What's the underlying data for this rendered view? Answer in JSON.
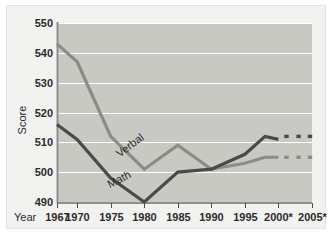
{
  "chart_data": {
    "type": "line",
    "title": "",
    "subtitle": "",
    "xlabel": "Year",
    "ylabel": "Score",
    "ylim": [
      490,
      550
    ],
    "yticks": [
      490,
      500,
      510,
      520,
      530,
      540,
      550
    ],
    "ytick_labels": [
      "490",
      "500",
      "510",
      "520",
      "530",
      "540",
      "550"
    ],
    "xlim": [
      1967,
      2005
    ],
    "xticks": [
      1967,
      1970,
      1975,
      1980,
      1985,
      1990,
      1995,
      2000,
      2005
    ],
    "xtick_labels": [
      "1967",
      "1970",
      "1975",
      "1980",
      "1985",
      "1990",
      "1995",
      "2000*",
      "2005*"
    ],
    "grid": "horizontal-white-gridlines",
    "legend": "inline-series-labels",
    "plot_background": "#c9c9c4",
    "series": [
      {
        "name": "Verbal",
        "color": "#8c8c87",
        "label_x": 1978.2,
        "label_y": 508.0,
        "label_rotation": -37,
        "x": [
          1967,
          1970,
          1975,
          1980,
          1985,
          1990,
          1995,
          1998,
          2000
        ],
        "values": [
          543,
          537,
          512,
          501,
          509,
          501,
          503,
          505,
          505
        ],
        "projected": {
          "style": "dotted",
          "x": [
            2001.2,
            2003,
            2004.7
          ],
          "value": 505
        }
      },
      {
        "name": "Math",
        "color": "#4a4a47",
        "label_x": 1976.5,
        "label_y": 496.5,
        "label_rotation": -27,
        "x": [
          1967,
          1970,
          1975,
          1980,
          1985,
          1990,
          1995,
          1998,
          2000
        ],
        "values": [
          516,
          511,
          498,
          490,
          500,
          501,
          506,
          512,
          511
        ],
        "projected": {
          "style": "dotted",
          "x": [
            2001.2,
            2003,
            2004.7
          ],
          "value": 512
        }
      }
    ],
    "annotations": []
  },
  "axis": {
    "year_label": "Year",
    "score_label": "Score"
  }
}
